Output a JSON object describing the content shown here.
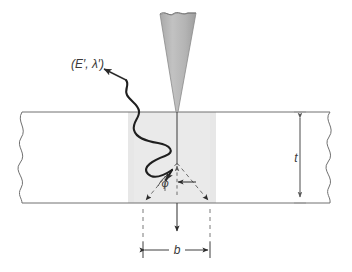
{
  "figure": {
    "background_color": "#ffffff",
    "line_color": "#5a5a5a",
    "dark_line_color": "#2b2b2b",
    "beam_fill_color": "#b0b0b0",
    "interaction_fill_color": "#e4e4e4"
  },
  "labels": {
    "scattered_ray": "(E′, λ′)",
    "scattered_ray_plain": "(E',X')",
    "thickness": "t",
    "beam_width": "b",
    "scatter_angle": "φ"
  },
  "elements": {
    "incident_beam": "incident-beam-cone",
    "slab": "sample-slab",
    "interaction_volume": "interaction-volume",
    "scattered_photon_path": "scattered-photon-wavy-path",
    "divergence_cone": "dashed-divergence-cone",
    "thickness_dimension": "thickness-dimension-t",
    "width_dimension": "width-dimension-b",
    "break_line_left": "left-break-line",
    "break_line_right": "right-break-line"
  },
  "geometry": {
    "slab_top_y": 112,
    "slab_bottom_y": 203,
    "beam_axis_x": 177,
    "shade_left_x": 128,
    "shade_right_x": 216,
    "b_left_x": 143,
    "b_right_x": 210,
    "t_dimension_x": 300
  }
}
